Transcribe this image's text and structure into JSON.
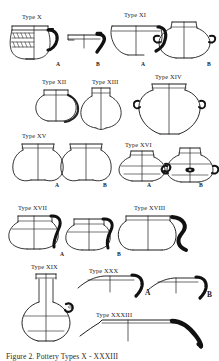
{
  "figure": {
    "kind": "archaeological-pottery-typology-plate",
    "background_color": "#ffffff",
    "ink_color": "#1a1a1a",
    "caption": "Figure 2. Pottery Types X - XXXIII",
    "caption_visible": "partially clipped at bottom edge"
  },
  "type_labels": [
    {
      "id": "type-x",
      "text": "Type X",
      "x": 22,
      "y": 14
    },
    {
      "id": "type-xi",
      "text": "Type XI",
      "x": 124,
      "y": 12
    },
    {
      "id": "type-xii",
      "text": "Type XII",
      "x": 42,
      "y": 79
    },
    {
      "id": "type-xiii",
      "text": "Type XIII",
      "x": 92,
      "y": 79
    },
    {
      "id": "type-xiv",
      "text": "Type XIV",
      "x": 155,
      "y": 74
    },
    {
      "id": "type-xv",
      "text": "Type XV",
      "x": 22,
      "y": 133
    },
    {
      "id": "type-xvi",
      "text": "Type XVI",
      "x": 125,
      "y": 142
    },
    {
      "id": "type-xvii",
      "text": "Type XVII",
      "x": 18,
      "y": 205
    },
    {
      "id": "type-xviii",
      "text": "Type XVIII",
      "x": 134,
      "y": 205
    },
    {
      "id": "type-xix",
      "text": "Type XIX",
      "x": 31,
      "y": 264
    },
    {
      "id": "type-xxx",
      "text": "Type XXX",
      "x": 89,
      "y": 268
    },
    {
      "id": "type-xxxiii",
      "text": "Type XXXIII",
      "x": 96,
      "y": 312
    }
  ],
  "variant_labels": [
    {
      "id": "x-a",
      "text": "A",
      "x": 56,
      "y": 62,
      "size": "small"
    },
    {
      "id": "x-b",
      "text": "B",
      "x": 96,
      "y": 62,
      "size": "small"
    },
    {
      "id": "xi-a",
      "text": "A",
      "x": 141,
      "y": 62,
      "size": "small"
    },
    {
      "id": "xi-b",
      "text": "B",
      "x": 207,
      "y": 62,
      "size": "small"
    },
    {
      "id": "xv-a",
      "text": "A",
      "x": 55,
      "y": 183,
      "size": "small"
    },
    {
      "id": "xv-b",
      "text": "B",
      "x": 103,
      "y": 183,
      "size": "small"
    },
    {
      "id": "xvi-a",
      "text": "A",
      "x": 147,
      "y": 183,
      "size": "small"
    },
    {
      "id": "xvi-b",
      "text": "B",
      "x": 199,
      "y": 183,
      "size": "small"
    },
    {
      "id": "xvii-a",
      "text": "A",
      "x": 60,
      "y": 252,
      "size": "small"
    },
    {
      "id": "xvii-b",
      "text": "B",
      "x": 117,
      "y": 252,
      "size": "small"
    },
    {
      "id": "xxx-a",
      "text": "A",
      "x": 145,
      "y": 289,
      "size": "big"
    },
    {
      "id": "xxx-b",
      "text": "B",
      "x": 207,
      "y": 291,
      "size": "big"
    }
  ],
  "vessels": [
    {
      "id": "x-a",
      "type": "Type X",
      "variant": "A",
      "form": "globular jar with banded incised decoration and loop handle"
    },
    {
      "id": "x-b",
      "type": "Type X",
      "variant": "B",
      "form": "rim and handle profile sherd"
    },
    {
      "id": "xi-a",
      "type": "Type XI",
      "variant": "A",
      "form": "open bowl profile with thickened rim"
    },
    {
      "id": "xi-b",
      "type": "Type XI",
      "variant": "B",
      "form": "carinated jar with lug handles"
    },
    {
      "id": "xii",
      "type": "Type XII",
      "variant": "",
      "form": "small collared jar"
    },
    {
      "id": "xiii",
      "type": "Type XIII",
      "variant": "",
      "form": "narrow-necked ovoid jar"
    },
    {
      "id": "xiv",
      "type": "Type XIV",
      "variant": "",
      "form": "large shouldered jar with flaring rim"
    },
    {
      "id": "xv-a",
      "type": "Type XV",
      "variant": "A",
      "form": "bag-shaped jar, plain rim"
    },
    {
      "id": "xv-b",
      "type": "Type XV",
      "variant": "B",
      "form": "bag-shaped jar, plain rim"
    },
    {
      "id": "xvi-a",
      "type": "Type XVI",
      "variant": "A",
      "form": "carinated jar with lug"
    },
    {
      "id": "xvi-b",
      "type": "Type XVI",
      "variant": "B",
      "form": "carinated jar with pierced lug handle"
    },
    {
      "id": "xvii-a",
      "type": "Type XVII",
      "variant": "A",
      "form": "cooking pot with strap handle"
    },
    {
      "id": "xvii-b",
      "type": "Type XVII",
      "variant": "B",
      "form": "cooking pot with strap handle"
    },
    {
      "id": "xviii",
      "type": "Type XVIII",
      "variant": "",
      "form": "wide jar with heavy S-profile handle"
    },
    {
      "id": "xix",
      "type": "Type XIX",
      "variant": "",
      "form": "long-necked bottle with shoulder lug"
    },
    {
      "id": "xxx-a",
      "type": "Type XXX",
      "variant": "A",
      "form": "shallow open bowl profile with inturned rim"
    },
    {
      "id": "xxx-b",
      "type": "Type XXX",
      "variant": "B",
      "form": "shallow open bowl profile"
    },
    {
      "id": "xxxiii",
      "type": "Type XXXIII",
      "variant": "",
      "form": "large shallow basin profile with thick ledge rim"
    }
  ]
}
